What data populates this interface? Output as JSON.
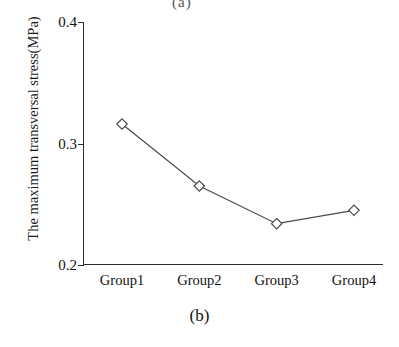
{
  "figure": {
    "top_fragment": "(a)",
    "caption": "(b)"
  },
  "chart_data": {
    "type": "line",
    "title": "",
    "subtitle": "",
    "xlabel": "",
    "ylabel": "The maximum transversal stress(MPa)",
    "categories": [
      "Group1",
      "Group2",
      "Group3",
      "Group4"
    ],
    "values": [
      0.316,
      0.265,
      0.234,
      0.245
    ],
    "series": [
      {
        "name": "The maximum transversal stress",
        "values": [
          0.316,
          0.265,
          0.234,
          0.245
        ],
        "marker": "diamond-open",
        "line_color": "#4a4a4a"
      }
    ],
    "ylim": [
      0.2,
      0.4
    ],
    "yticks": [
      0.2,
      0.3,
      0.4
    ],
    "ytick_labels": [
      "0.2",
      "0.3",
      "0.4"
    ],
    "xtick_labels": [
      "Group1",
      "Group2",
      "Group3",
      "Group4"
    ],
    "grid": false,
    "legend": false,
    "legend_position": "none"
  }
}
